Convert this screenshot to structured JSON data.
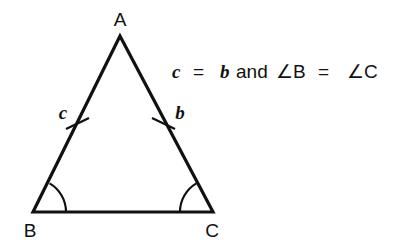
{
  "figure": {
    "type": "isosceles-triangle-diagram",
    "vertices": [
      {
        "name": "A",
        "label": "A",
        "x": 120,
        "y": 36,
        "label_x": 120,
        "label_y": 26
      },
      {
        "name": "B",
        "label": "B",
        "x": 33,
        "y": 212,
        "label_x": 30,
        "label_y": 236
      },
      {
        "name": "C",
        "label": "C",
        "x": 213,
        "y": 212,
        "label_x": 212,
        "label_y": 236
      }
    ],
    "side_labels": [
      {
        "name": "c",
        "label": "c",
        "side": "AB",
        "x": 63,
        "y": 118
      },
      {
        "name": "b",
        "label": "b",
        "side": "AC",
        "x": 180,
        "y": 118
      }
    ],
    "tick_marks": [
      {
        "side": "AB",
        "cx": 77,
        "cy": 124
      },
      {
        "side": "AC",
        "cx": 163,
        "cy": 124
      }
    ],
    "angle_arcs": [
      {
        "vertex": "B",
        "radius": 33
      },
      {
        "vertex": "C",
        "radius": 33
      }
    ],
    "stroke_color": "#111111",
    "background_color": "#ffffff"
  },
  "equation": {
    "full_text": "c = b and ∠B = ∠C",
    "parts": {
      "var_c": "c",
      "equals_1": "=",
      "var_b": "b",
      "conjunction": "and",
      "angle_b": "∠B",
      "equals_2": "=",
      "angle_c": "∠C"
    },
    "x": 172,
    "y": 78
  }
}
